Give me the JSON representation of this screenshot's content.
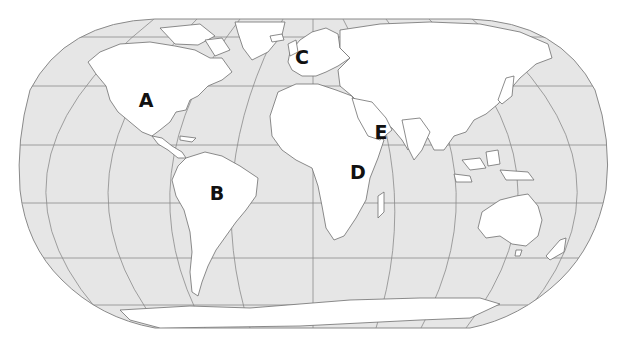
{
  "map": {
    "projection": "Robinson-like world map",
    "ocean_color": "#e6e6e6",
    "land_color": "#ffffff",
    "border_color": "#777777",
    "graticule_color": "#8a8a8a"
  },
  "labels": [
    {
      "id": "A",
      "text": "A",
      "x": 146,
      "y": 100,
      "region": "North America"
    },
    {
      "id": "B",
      "text": "B",
      "x": 217,
      "y": 193,
      "region": "South America"
    },
    {
      "id": "C",
      "text": "C",
      "x": 302,
      "y": 57,
      "region": "Western Europe"
    },
    {
      "id": "D",
      "text": "D",
      "x": 358,
      "y": 172,
      "region": "East Africa"
    },
    {
      "id": "E",
      "text": "E",
      "x": 381,
      "y": 132,
      "region": "Arabian Peninsula"
    }
  ]
}
